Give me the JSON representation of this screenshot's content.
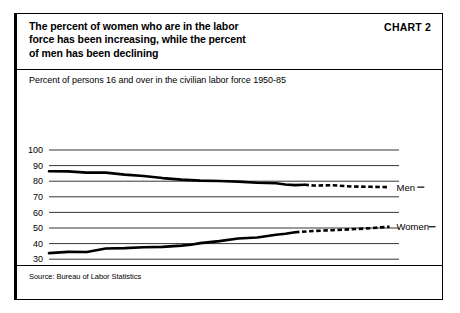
{
  "header": {
    "title": "The percent of women who are in the labor\nforce has been increasing, while the percent\nof men has been declining",
    "chart_number": "CHART 2"
  },
  "footer": {
    "source": "Source: Bureau of Labor Statistics"
  },
  "chart_data": {
    "type": "line",
    "title": "The percent of women who are in the labor force has been increasing, while the percent of men has been declining",
    "subtitle": "Percent of persons 16 and over in the civilian labor force 1950-85",
    "xlabel": "",
    "ylabel": "",
    "xlim": [
      1950,
      1987
    ],
    "ylim": [
      0,
      100
    ],
    "grid": true,
    "legend_position": "right-inline",
    "xticks": [
      1950,
      1955,
      1960,
      1965,
      1970,
      1975,
      1980,
      1985
    ],
    "yticks": [
      0,
      10,
      20,
      30,
      40,
      50,
      60,
      70,
      80,
      90,
      100
    ],
    "series": [
      {
        "name": "Men",
        "label": "Men",
        "style": "solid-then-dashed",
        "dash_starts_at": 1977,
        "x": [
          1950,
          1952,
          1954,
          1956,
          1958,
          1960,
          1962,
          1964,
          1965,
          1966,
          1968,
          1970,
          1972,
          1974,
          1975,
          1976,
          1977,
          1978,
          1980,
          1982,
          1984,
          1985,
          1986
        ],
        "values": [
          86.4,
          86.3,
          85.5,
          85.5,
          84.2,
          83.3,
          82.0,
          81.0,
          80.7,
          80.4,
          80.1,
          79.7,
          79.0,
          78.7,
          77.9,
          77.5,
          77.7,
          77.2,
          77.4,
          76.6,
          76.4,
          76.3,
          76.2
        ]
      },
      {
        "name": "Women",
        "label": "Women",
        "style": "solid-then-dashed",
        "dash_starts_at": 1976,
        "x": [
          1950,
          1952,
          1954,
          1956,
          1958,
          1960,
          1962,
          1964,
          1965,
          1966,
          1968,
          1970,
          1972,
          1974,
          1975,
          1976,
          1978,
          1980,
          1982,
          1984,
          1985,
          1986
        ],
        "values": [
          33.9,
          34.7,
          34.6,
          36.9,
          37.1,
          37.7,
          37.9,
          38.7,
          39.3,
          40.3,
          41.6,
          43.3,
          43.9,
          45.7,
          46.3,
          47.3,
          48.1,
          48.6,
          49.2,
          49.9,
          50.4,
          50.8
        ]
      }
    ]
  }
}
